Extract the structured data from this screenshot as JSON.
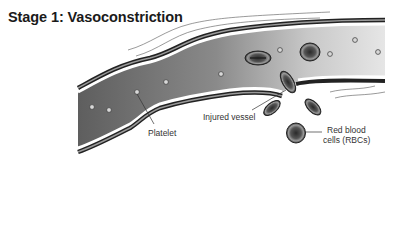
{
  "title": "Stage 1: Vasoconstriction",
  "labels": {
    "platelet": "Platelet",
    "injured_vessel": "Injured vessel",
    "rbc_line1": "Red blood",
    "rbc_line2": "cells (RBCs)"
  },
  "colors": {
    "vessel_wall": "#3a3a3a",
    "lumen_dark": "#6a6a6a",
    "lumen_light": "#e0e0e0",
    "rbc_fill": "#707070",
    "text": "#333333"
  }
}
